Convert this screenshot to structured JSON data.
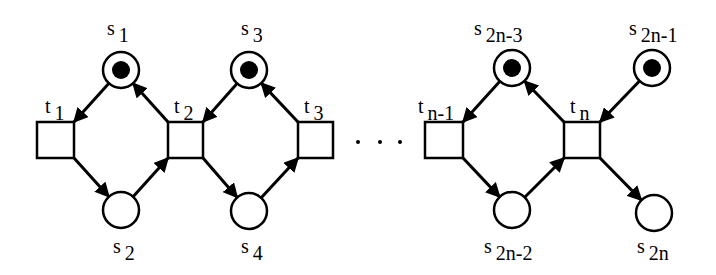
{
  "diagram": {
    "type": "petri-net",
    "places": [
      {
        "id": "s1",
        "base": "s",
        "sub": "1",
        "cx": 121,
        "cy": 70,
        "marked": true,
        "lx": 107,
        "ly": 18
      },
      {
        "id": "s2",
        "base": "s",
        "sub": "2",
        "cx": 121,
        "cy": 210,
        "marked": false,
        "lx": 113,
        "ly": 236
      },
      {
        "id": "s3",
        "base": "s",
        "sub": "3",
        "cx": 249,
        "cy": 70,
        "marked": true,
        "lx": 241,
        "ly": 18
      },
      {
        "id": "s4",
        "base": "s",
        "sub": "4",
        "cx": 249,
        "cy": 211,
        "marked": false,
        "lx": 241,
        "ly": 236
      },
      {
        "id": "s2n-3",
        "base": "s",
        "sub": "2n-3",
        "cx": 512,
        "cy": 68,
        "marked": true,
        "lx": 474,
        "ly": 18
      },
      {
        "id": "s2n-2",
        "base": "s",
        "sub": "2n-2",
        "cx": 512,
        "cy": 210,
        "marked": false,
        "lx": 484,
        "ly": 236
      },
      {
        "id": "s2n-1",
        "base": "s",
        "sub": "2n-1",
        "cx": 652,
        "cy": 68,
        "marked": true,
        "lx": 629,
        "ly": 18
      },
      {
        "id": "s2n",
        "base": "s",
        "sub": "2n",
        "cx": 654,
        "cy": 213,
        "marked": false,
        "lx": 637,
        "ly": 236
      }
    ],
    "transitions": [
      {
        "id": "t1",
        "base": "t",
        "sub": "1",
        "x": 37,
        "y": 122,
        "w": 37,
        "h": 36,
        "lx": 45,
        "ly": 96
      },
      {
        "id": "t2",
        "base": "t",
        "sub": "2",
        "x": 168,
        "y": 122,
        "w": 35,
        "h": 36,
        "lx": 174,
        "ly": 96
      },
      {
        "id": "t3",
        "base": "t",
        "sub": "3",
        "x": 298,
        "y": 122,
        "w": 35,
        "h": 36,
        "lx": 304,
        "ly": 96
      },
      {
        "id": "tn-1",
        "base": "t",
        "sub": "n-1",
        "x": 425,
        "y": 122,
        "w": 38,
        "h": 36,
        "lx": 418,
        "ly": 96
      },
      {
        "id": "tn",
        "base": "t",
        "sub": "n",
        "x": 564,
        "y": 122,
        "w": 36,
        "h": 36,
        "lx": 570,
        "ly": 96
      }
    ],
    "arcs": [
      {
        "from": "s1",
        "to": "t1"
      },
      {
        "from": "t1",
        "to": "s2"
      },
      {
        "from": "s2",
        "to": "t2"
      },
      {
        "from": "t2",
        "to": "s1"
      },
      {
        "from": "s3",
        "to": "t2"
      },
      {
        "from": "t2",
        "to": "s4"
      },
      {
        "from": "s4",
        "to": "t3"
      },
      {
        "from": "t3",
        "to": "s3"
      },
      {
        "from": "s2n-3",
        "to": "tn-1"
      },
      {
        "from": "tn-1",
        "to": "s2n-2"
      },
      {
        "from": "s2n-2",
        "to": "tn"
      },
      {
        "from": "tn",
        "to": "s2n-3"
      },
      {
        "from": "s2n-1",
        "to": "tn"
      },
      {
        "from": "tn",
        "to": "s2n"
      }
    ],
    "ellipsis": {
      "text": "· · ·",
      "dots": [
        [
          358,
          142
        ],
        [
          380,
          142
        ],
        [
          400,
          142
        ]
      ]
    },
    "colors": {
      "stroke": "#000000",
      "fill": "#ffffff",
      "token": "#000000"
    }
  }
}
